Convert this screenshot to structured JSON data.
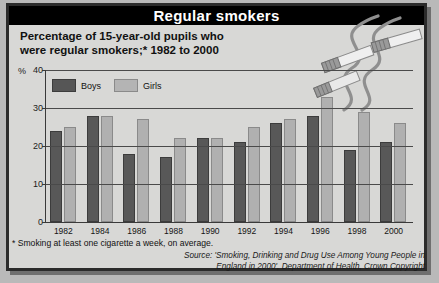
{
  "header": {
    "title": "Regular smokers"
  },
  "subtitle": {
    "line1": "Percentage of 15-year-old pupils who",
    "line2": "were regular smokers;* 1982 to 2000"
  },
  "legend": {
    "boys": "Boys",
    "girls": "Girls"
  },
  "axis": {
    "unit": "%"
  },
  "footnote": "* Smoking at least one cigarette a week, on average.",
  "source": {
    "line1": "Source: 'Smoking, Drinking and Drug Use Among Young  People in",
    "line2": "England in 2000', Department of Health,  Crown Copyright"
  },
  "colors": {
    "boys": "#585858",
    "girls": "#b0b0b0",
    "header_bg": "#000000",
    "panel_bg": "#d8d8d6",
    "frame": "#2b2b2b"
  },
  "chart_data": {
    "type": "bar",
    "title": "Percentage of 15-year-old pupils who were regular smokers;* 1982 to 2000",
    "xlabel": "",
    "ylabel": "%",
    "ylim": [
      0,
      40
    ],
    "yticks": [
      0,
      10,
      20,
      30,
      40
    ],
    "grid": true,
    "legend_position": "top-left",
    "categories": [
      "1982",
      "1984",
      "1986",
      "1988",
      "1990",
      "1992",
      "1994",
      "1996",
      "1998",
      "2000"
    ],
    "series": [
      {
        "name": "Boys",
        "values": [
          24,
          28,
          18,
          17,
          22,
          21,
          26,
          28,
          19,
          21
        ]
      },
      {
        "name": "Girls",
        "values": [
          25,
          28,
          27,
          22,
          22,
          25,
          27,
          33,
          29,
          26
        ]
      }
    ]
  }
}
